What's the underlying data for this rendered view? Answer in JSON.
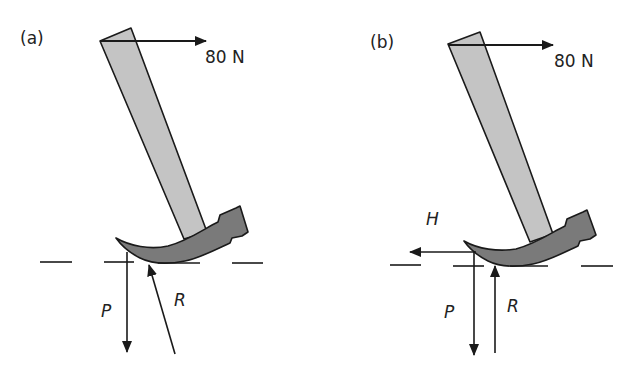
{
  "figure": {
    "colors": {
      "handle_fill": "#c4c4c4",
      "head_fill": "#7a7a7a",
      "stroke": "#1a1a1a",
      "background": "#ffffff"
    },
    "panels": [
      {
        "id": "a",
        "label": "(a)",
        "applied_force": "80 N",
        "forces": [
          "P",
          "R"
        ]
      },
      {
        "id": "b",
        "label": "(b)",
        "applied_force": "80 N",
        "forces": [
          "H",
          "P",
          "R"
        ]
      }
    ]
  }
}
